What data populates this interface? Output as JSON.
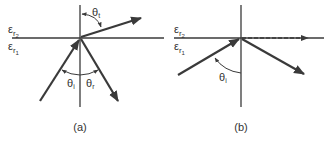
{
  "figure": {
    "colors": {
      "line": "#3a3a3a",
      "text": "#333333",
      "background": "#ffffff"
    },
    "panel_a": {
      "caption": "(a)",
      "medium_upper": {
        "symbol": "ε",
        "sub": "r",
        "subsub": "2"
      },
      "medium_lower": {
        "symbol": "ε",
        "sub": "r",
        "subsub": "1"
      },
      "angles": {
        "incident": {
          "symbol": "θ",
          "sub": "i"
        },
        "reflected": {
          "symbol": "θ",
          "sub": "r"
        },
        "transmitted": {
          "symbol": "θ",
          "sub": "t"
        }
      },
      "rays": [
        "incident",
        "reflected",
        "transmitted"
      ]
    },
    "panel_b": {
      "caption": "(b)",
      "medium_upper": {
        "symbol": "ε",
        "sub": "r",
        "subsub": "2"
      },
      "medium_lower": {
        "symbol": "ε",
        "sub": "r",
        "subsub": "1"
      },
      "angles": {
        "incident": {
          "symbol": "θ",
          "sub": "i"
        }
      },
      "rays": [
        "incident",
        "reflected",
        "surface-wave (dashed)"
      ]
    }
  }
}
